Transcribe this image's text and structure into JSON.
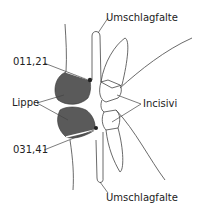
{
  "diagram": {
    "labels": {
      "fold_top": "Umschlagfalte",
      "tooth_upper": "011,21",
      "lip": "Lippe",
      "incisors": "Incisivi",
      "tooth_lower": "031,41",
      "fold_bottom": "Umschlagfalte"
    },
    "colors": {
      "lip_fill": "#5a5a5a",
      "line": "#444444",
      "background": "#ffffff"
    }
  }
}
